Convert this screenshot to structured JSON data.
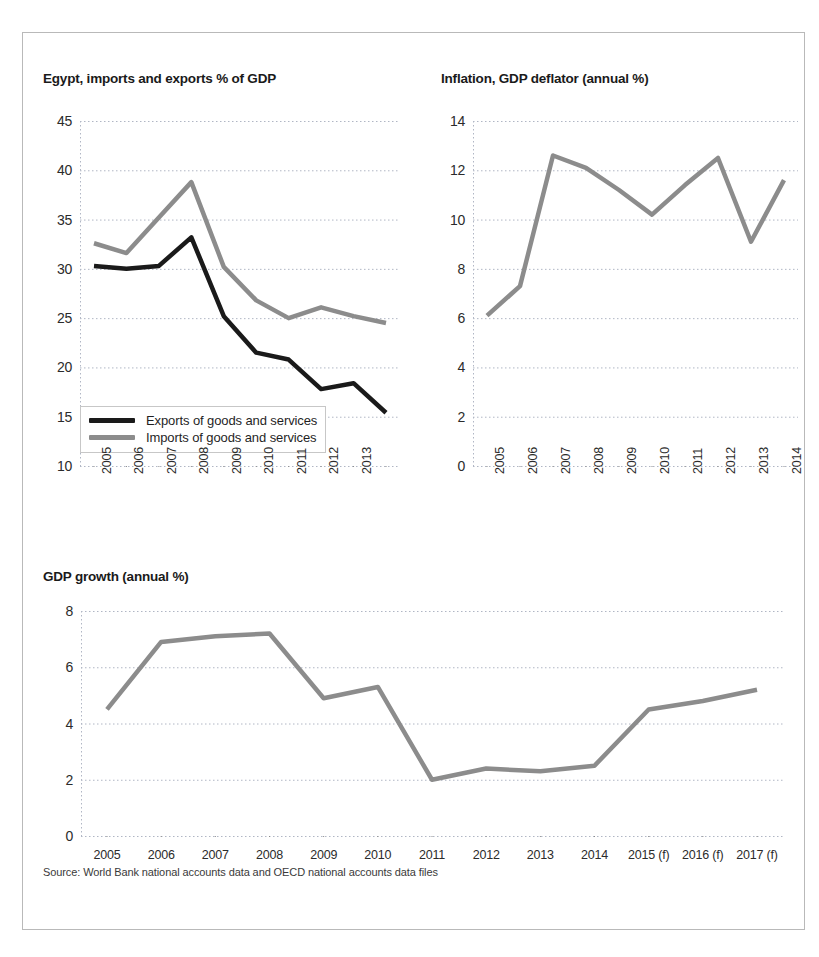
{
  "figure": {
    "border_color": "#b9b9b9",
    "background": "#ffffff",
    "source_note": "Source: World Bank national accounts data and OECD national accounts data files"
  },
  "colors": {
    "exports_line": "#1a1a1a",
    "imports_line": "#8c8c8c",
    "grid": "#b0b6c4",
    "axis": "#8a8a8a",
    "text": "#2b2b2b"
  },
  "chart_data": [
    {
      "type": "line",
      "title": "Egypt, imports and exports % of GDP",
      "xlabel": "",
      "ylabel": "",
      "categories": [
        "2005",
        "2006",
        "2007",
        "2008",
        "2009",
        "2010",
        "2011",
        "2012",
        "2013",
        "2014"
      ],
      "tick_labels": [
        "2005",
        "2006",
        "2007",
        "2008",
        "2009",
        "2010",
        "2011",
        "2012",
        "2013"
      ],
      "ylim": [
        10,
        45
      ],
      "yticks": [
        10,
        15,
        20,
        25,
        30,
        35,
        40,
        45
      ],
      "grid": true,
      "legend_position": "bottom-left",
      "series": [
        {
          "name": "Exports of goods and services",
          "color": "#1a1a1a",
          "values": [
            30.3,
            30.0,
            30.3,
            33.2,
            25.2,
            21.5,
            20.8,
            17.8,
            18.4,
            15.4
          ]
        },
        {
          "name": "Imports of goods and services",
          "color": "#8c8c8c",
          "values": [
            32.6,
            31.6,
            35.2,
            38.8,
            30.2,
            26.8,
            25.0,
            26.1,
            25.2,
            24.5
          ]
        }
      ]
    },
    {
      "type": "line",
      "title": "Inflation, GDP deflator (annual %)",
      "xlabel": "",
      "ylabel": "",
      "categories": [
        "2005",
        "2006",
        "2007",
        "2008",
        "2009",
        "2010",
        "2011",
        "2012",
        "2013",
        "2014"
      ],
      "tick_labels": [
        "2005",
        "2006",
        "2007",
        "2008",
        "2009",
        "2010",
        "2011",
        "2012",
        "2013",
        "2014"
      ],
      "ylim": [
        0,
        14
      ],
      "yticks": [
        0,
        2,
        4,
        6,
        8,
        10,
        12,
        14
      ],
      "grid": true,
      "legend_position": "none",
      "series": [
        {
          "name": "Inflation, GDP deflator (annual %)",
          "color": "#8c8c8c",
          "values": [
            6.1,
            7.3,
            12.6,
            12.1,
            11.2,
            10.2,
            11.4,
            12.5,
            9.1,
            11.6
          ]
        }
      ]
    },
    {
      "type": "line",
      "title": "GDP growth (annual %)",
      "xlabel": "",
      "ylabel": "",
      "categories": [
        "2005",
        "2006",
        "2007",
        "2008",
        "2009",
        "2010",
        "2011",
        "2012",
        "2013",
        "2014",
        "2015 (f)",
        "2016 (f)",
        "2017 (f)"
      ],
      "tick_labels": [
        "2005",
        "2006",
        "2007",
        "2008",
        "2009",
        "2010",
        "2011",
        "2012",
        "2013",
        "2014",
        "2015 (f)",
        "2016 (f)",
        "2017 (f)"
      ],
      "ylim": [
        0,
        8
      ],
      "yticks": [
        0,
        2,
        4,
        6,
        8
      ],
      "grid": true,
      "legend_position": "none",
      "series": [
        {
          "name": "GDP growth (annual %)",
          "color": "#8c8c8c",
          "values": [
            4.5,
            6.9,
            7.1,
            7.2,
            4.9,
            5.3,
            2.0,
            2.4,
            2.3,
            2.5,
            4.5,
            4.8,
            5.2
          ]
        }
      ]
    }
  ]
}
